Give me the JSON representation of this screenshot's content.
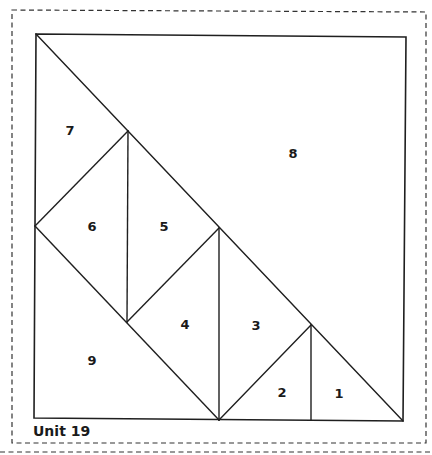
{
  "unit": {
    "title": "Unit 19"
  },
  "pieces": [
    {
      "id": "1",
      "label": "1",
      "x": 339,
      "y": 398
    },
    {
      "id": "2",
      "label": "2",
      "x": 282,
      "y": 397
    },
    {
      "id": "3",
      "label": "3",
      "x": 256,
      "y": 330
    },
    {
      "id": "4",
      "label": "4",
      "x": 185,
      "y": 329
    },
    {
      "id": "5",
      "label": "5",
      "x": 164,
      "y": 231
    },
    {
      "id": "6",
      "label": "6",
      "x": 92,
      "y": 231
    },
    {
      "id": "7",
      "label": "7",
      "x": 70,
      "y": 135
    },
    {
      "id": "8",
      "label": "8",
      "x": 293,
      "y": 158
    },
    {
      "id": "9",
      "label": "9",
      "x": 92,
      "y": 365
    }
  ],
  "colors": {
    "line": "#1f1f1f",
    "background": "#ffffff"
  }
}
